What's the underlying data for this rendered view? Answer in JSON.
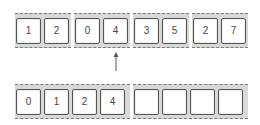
{
  "top_row": {
    "groups": [
      {
        "cells": [
          "1",
          "2"
        ]
      },
      {
        "cells": [
          "0",
          "4"
        ]
      },
      {
        "cells": [
          "3",
          "5"
        ]
      },
      {
        "cells": [
          "2",
          "7"
        ]
      }
    ]
  },
  "pointer": {
    "direction": "up",
    "target_group": 1,
    "target_cell": 1
  },
  "bottom_row": {
    "groups": [
      {
        "cells": [
          "0",
          "1",
          "2",
          "4"
        ]
      },
      {
        "cells": [
          "",
          "",
          "",
          ""
        ]
      }
    ]
  },
  "colors": {
    "frame": "#d8d8d8",
    "cell_border": "#555555",
    "text": "#444444",
    "arrow": "#555555"
  }
}
